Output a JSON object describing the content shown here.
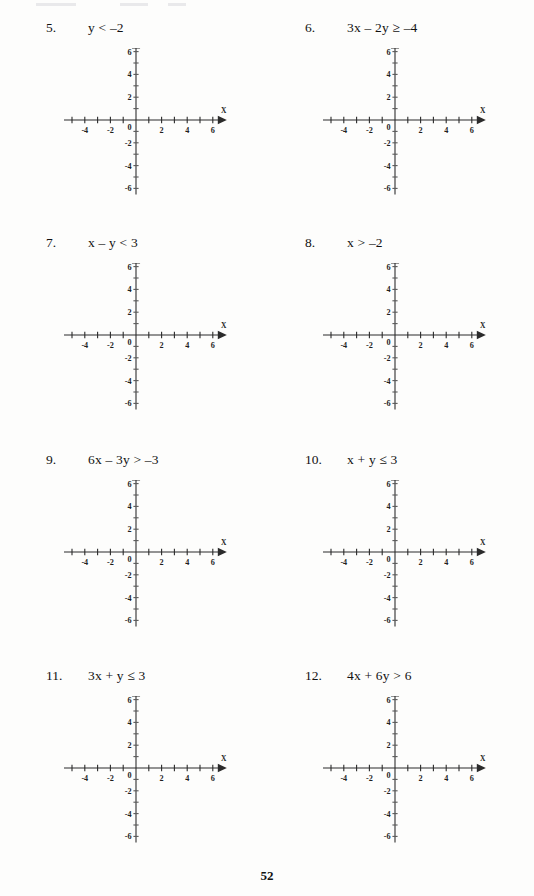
{
  "document": {
    "type": "math-worksheet",
    "topic": "graphing-linear-inequalities",
    "page_number": "52"
  },
  "axes": {
    "x_label": "X",
    "y_label": "Y",
    "x_min": -6,
    "x_max": 6,
    "y_min": -6,
    "y_max": 6,
    "tick_step": 1,
    "label_step": 2,
    "x_tick_labels": [
      "-6",
      "-4",
      "-2",
      "0",
      "2",
      "4",
      "6"
    ],
    "y_tick_labels": [
      "6",
      "4",
      "2",
      "0",
      "-2",
      "-4",
      "-6"
    ],
    "origin_label": "0",
    "grid": false,
    "arrows": [
      "x-positive",
      "y-positive"
    ],
    "line_color": "#2b2b2b"
  },
  "problems": [
    {
      "number": "5.",
      "expression": "y < –2"
    },
    {
      "number": "6.",
      "expression": "3x – 2y ≥ –4"
    },
    {
      "number": "7.",
      "expression": "x – y < 3"
    },
    {
      "number": "8.",
      "expression": "x > –2"
    },
    {
      "number": "9.",
      "expression": "6x – 3y > –3"
    },
    {
      "number": "10.",
      "expression": "x + y ≤ 3"
    },
    {
      "number": "11.",
      "expression": "3x + y ≤ 3"
    },
    {
      "number": "12.",
      "expression": "4x + 6y > 6"
    }
  ],
  "chart_data": [
    {
      "type": "scatter",
      "title": "",
      "xlabel": "X",
      "ylabel": "Y",
      "xlim": [
        -6,
        6
      ],
      "ylim": [
        -6,
        6
      ],
      "x": [],
      "y": [],
      "annotations": [
        "y < -2"
      ],
      "grid": false
    },
    {
      "type": "scatter",
      "title": "",
      "xlabel": "X",
      "ylabel": "Y",
      "xlim": [
        -6,
        6
      ],
      "ylim": [
        -6,
        6
      ],
      "x": [],
      "y": [],
      "annotations": [
        "3x - 2y >= -4"
      ],
      "grid": false
    },
    {
      "type": "scatter",
      "title": "",
      "xlabel": "X",
      "ylabel": "Y",
      "xlim": [
        -6,
        6
      ],
      "ylim": [
        -6,
        6
      ],
      "x": [],
      "y": [],
      "annotations": [
        "x - y < 3"
      ],
      "grid": false
    },
    {
      "type": "scatter",
      "title": "",
      "xlabel": "X",
      "ylabel": "Y",
      "xlim": [
        -6,
        6
      ],
      "ylim": [
        -6,
        6
      ],
      "x": [],
      "y": [],
      "annotations": [
        "x > -2"
      ],
      "grid": false
    },
    {
      "type": "scatter",
      "title": "",
      "xlabel": "X",
      "ylabel": "Y",
      "xlim": [
        -6,
        6
      ],
      "ylim": [
        -6,
        6
      ],
      "x": [],
      "y": [],
      "annotations": [
        "6x - 3y > -3"
      ],
      "grid": false
    },
    {
      "type": "scatter",
      "title": "",
      "xlabel": "X",
      "ylabel": "Y",
      "xlim": [
        -6,
        6
      ],
      "ylim": [
        -6,
        6
      ],
      "x": [],
      "y": [],
      "annotations": [
        "x + y <= 3"
      ],
      "grid": false
    },
    {
      "type": "scatter",
      "title": "",
      "xlabel": "X",
      "ylabel": "Y",
      "xlim": [
        -6,
        6
      ],
      "ylim": [
        -6,
        6
      ],
      "x": [],
      "y": [],
      "annotations": [
        "3x + y <= 3"
      ],
      "grid": false
    },
    {
      "type": "scatter",
      "title": "",
      "xlabel": "X",
      "ylabel": "Y",
      "xlim": [
        -6,
        6
      ],
      "ylim": [
        -6,
        6
      ],
      "x": [],
      "y": [],
      "annotations": [
        "4x + 6y > 6"
      ],
      "grid": false
    }
  ]
}
